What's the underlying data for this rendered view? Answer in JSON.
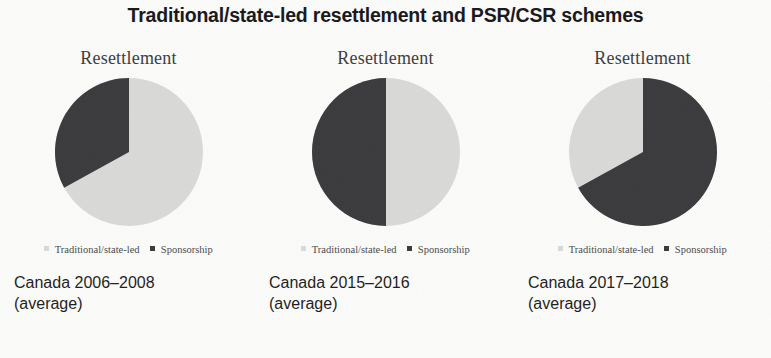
{
  "figure": {
    "title": "Traditional/state-led resettlement and PSR/CSR schemes",
    "panel_heading": "Resettlement",
    "legend": {
      "traditional_label": "Traditional/state-led",
      "sponsorship_label": "Sponsorship"
    }
  },
  "colors": {
    "background": "#fbfbfa",
    "traditional": "#d9d9d7",
    "sponsorship": "#3a3a3c",
    "title_text": "#17171a",
    "heading_text": "#3b3b3d",
    "caption_text": "#1d1d20",
    "legend_text": "#4a4a4c"
  },
  "panels": [
    {
      "heading": "Resettlement",
      "caption_line1": "Canada 2006–2008",
      "caption_line2": "(average)",
      "legend_traditional": "Traditional/state-led",
      "legend_sponsorship": "Sponsorship"
    },
    {
      "heading": "Resettlement",
      "caption_line1": "Canada 2015–2016",
      "caption_line2": "(average)",
      "legend_traditional": "Traditional/state-led",
      "legend_sponsorship": "Sponsorship"
    },
    {
      "heading": "Resettlement",
      "caption_line1": "Canada 2017–2018",
      "caption_line2": "(average)",
      "legend_traditional": "Traditional/state-led",
      "legend_sponsorship": "Sponsorship"
    }
  ],
  "chart_data": {
    "type": "pie",
    "title": "Traditional/state-led resettlement and PSR/CSR schemes",
    "legend_position": "bottom",
    "series_names": [
      "Traditional/state-led",
      "Sponsorship"
    ],
    "series_colors": [
      "#d9d9d7",
      "#3a3a3c"
    ],
    "charts": [
      {
        "title": "Resettlement",
        "subtitle": "Canada 2006–2008 (average)",
        "labels": [
          "Traditional/state-led",
          "Sponsorship"
        ],
        "values": [
          67,
          33
        ],
        "start_angle_deg": 0,
        "direction": "counterclockwise"
      },
      {
        "title": "Resettlement",
        "subtitle": "Canada 2015–2016 (average)",
        "labels": [
          "Traditional/state-led",
          "Sponsorship"
        ],
        "values": [
          50,
          50
        ],
        "start_angle_deg": 0,
        "direction": "counterclockwise"
      },
      {
        "title": "Resettlement",
        "subtitle": "Canada 2017–2018 (average)",
        "labels": [
          "Traditional/state-led",
          "Sponsorship"
        ],
        "values": [
          33,
          67
        ],
        "start_angle_deg": 0,
        "direction": "clockwise"
      }
    ]
  }
}
